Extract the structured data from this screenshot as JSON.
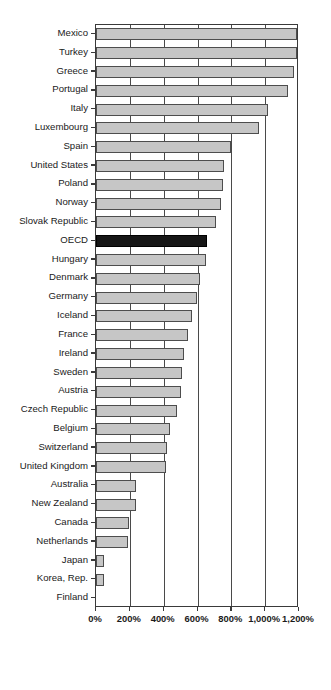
{
  "chart_data": {
    "type": "bar",
    "orientation": "horizontal",
    "title": "",
    "subtitle": "",
    "xlabel": "",
    "ylabel": "",
    "xlim": [
      0,
      1200
    ],
    "ylim": null,
    "grid": true,
    "legend": null,
    "legend_position": "none",
    "unit": "%",
    "xticks": [
      0,
      200,
      400,
      600,
      800,
      1000,
      1200
    ],
    "xtick_labels": [
      "0%",
      "200%",
      "400%",
      "600%",
      "800%",
      "1,000%",
      "1,200%"
    ],
    "highlight_category": "OECD",
    "colors": {
      "bar_fill": "#c6c6c6",
      "bar_border": "#4d4d4d",
      "highlight_fill": "#161616",
      "highlight_border": "#000000",
      "axis": "#3a3a3a",
      "grid": "#4a4a4a",
      "text": "#1a1a1a",
      "background": "#ffffff"
    },
    "categories": [
      "Mexico",
      "Turkey",
      "Greece",
      "Portugal",
      "Italy",
      "Luxembourg",
      "Spain",
      "United States",
      "Poland",
      "Norway",
      "Slovak Republic",
      "OECD",
      "Hungary",
      "Denmark",
      "Germany",
      "Iceland",
      "France",
      "Ireland",
      "Sweden",
      "Austria",
      "Czech Republic",
      "Belgium",
      "Switzerland",
      "United Kingdom",
      "Australia",
      "New Zealand",
      "Canada",
      "Netherlands",
      "Japan",
      "Korea, Rep.",
      "Finland"
    ],
    "values": [
      1190,
      1190,
      1170,
      1135,
      1015,
      965,
      800,
      755,
      750,
      740,
      710,
      657,
      650,
      615,
      595,
      565,
      545,
      520,
      510,
      500,
      480,
      440,
      420,
      415,
      235,
      235,
      195,
      190,
      50,
      50,
      0
    ]
  }
}
